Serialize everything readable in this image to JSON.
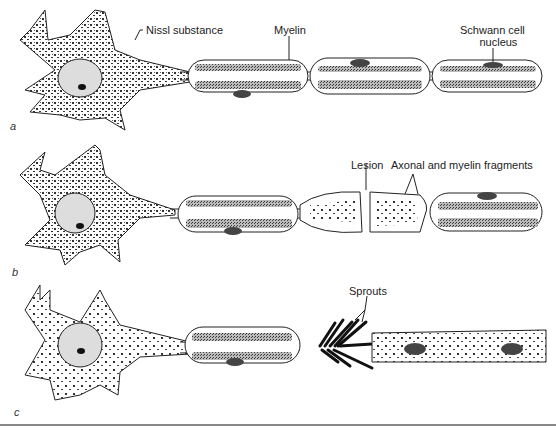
{
  "figure": {
    "panels": [
      {
        "id": "a",
        "label": "a",
        "state": "normal neuron"
      },
      {
        "id": "b",
        "label": "b",
        "state": "after lesion"
      },
      {
        "id": "c",
        "label": "c",
        "state": "regeneration"
      }
    ],
    "annotations": {
      "nissl": "Nissl substance",
      "myelin": "Myelin",
      "schwann_line1": "Schwann cell",
      "schwann_line2": "nucleus",
      "lesion": "Lesion",
      "fragments": "Axonal and myelin fragments",
      "sprouts": "Sprouts"
    },
    "colors": {
      "ink": "#1a1a1a",
      "stipple": "#555555",
      "background": "#ffffff"
    }
  }
}
